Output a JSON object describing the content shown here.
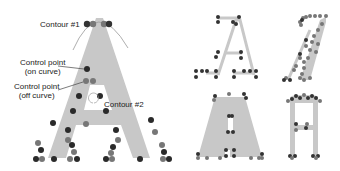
{
  "labels": {
    "contour1": "Contour #1",
    "control_on_1": "Control point",
    "control_on_2": "(on curve)",
    "control_off_1": "Control point",
    "control_off_2": "(off curve)",
    "contour2": "Contour #2"
  },
  "colors": {
    "glyph_fill": "#c8c8c8",
    "point_on": "#2a2a2a",
    "point_off": "#7a7a7a",
    "arrow": "#888888"
  },
  "panels": [
    {
      "name": "main-glyph-A",
      "description": "Large sans-serif A with labeled contours and control points"
    },
    {
      "name": "serif-A-outline",
      "description": "Thin serif A with control points"
    },
    {
      "name": "italic-A-outline",
      "description": "Italic script A with control points"
    },
    {
      "name": "bold-A",
      "description": "Bold trapezoid A with control points"
    },
    {
      "name": "narrow-A",
      "description": "Narrow square A with control points"
    }
  ]
}
